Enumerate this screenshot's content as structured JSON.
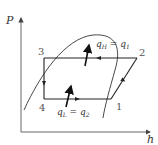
{
  "diagram": {
    "type": "P-h diagram (refrigeration cycle)",
    "axes": {
      "y_label": "P",
      "x_label": "h"
    },
    "states": [
      {
        "id": "1",
        "label": "1"
      },
      {
        "id": "2",
        "label": "2"
      },
      {
        "id": "3",
        "label": "3"
      },
      {
        "id": "4",
        "label": "4"
      }
    ],
    "heat_labels": {
      "rejected": {
        "main": "q",
        "main_sub": "H",
        "eq": " = ",
        "alt": "q",
        "alt_sub": "1"
      },
      "absorbed": {
        "main": "q",
        "main_sub": "L",
        "eq": " = ",
        "alt": "q",
        "alt_sub": "2"
      }
    },
    "colors": {
      "line": "#222222",
      "axis": "#555555",
      "text": "#333333"
    }
  }
}
